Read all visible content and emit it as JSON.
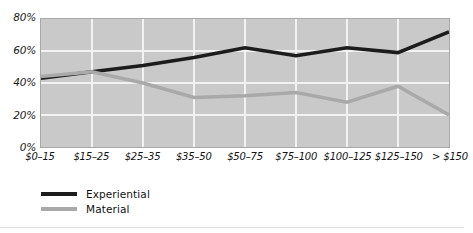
{
  "chart_data": {
    "type": "line",
    "title": "",
    "xlabel": "",
    "ylabel": "",
    "categories": [
      "$0–15",
      "$15–25",
      "$25–35",
      "$35–50",
      "$50–75",
      "$75–100",
      "$100–125",
      "$125–150",
      "> $150"
    ],
    "series": [
      {
        "name": "Experiential",
        "color": "#1c1c1c",
        "values": [
          43,
          47,
          51,
          56,
          62,
          57,
          62,
          59,
          72
        ]
      },
      {
        "name": "Material",
        "color": "#a9a9a9",
        "values": [
          44,
          47,
          40,
          31,
          32,
          34,
          28,
          38,
          20
        ]
      }
    ],
    "ylim": [
      0,
      80
    ],
    "yticks": [
      0,
      20,
      40,
      60,
      80
    ],
    "ytick_labels": [
      "0%",
      "20%",
      "40%",
      "60%",
      "80%"
    ],
    "grid": true,
    "grid_color": "#f2f2f2",
    "plot_background": "#c9c9c9",
    "legend_position": "below-left"
  },
  "legend": {
    "entries": [
      {
        "label": "Experiential",
        "color": "#1c1c1c"
      },
      {
        "label": "Material",
        "color": "#a9a9a9"
      }
    ]
  },
  "title_remnant": ""
}
